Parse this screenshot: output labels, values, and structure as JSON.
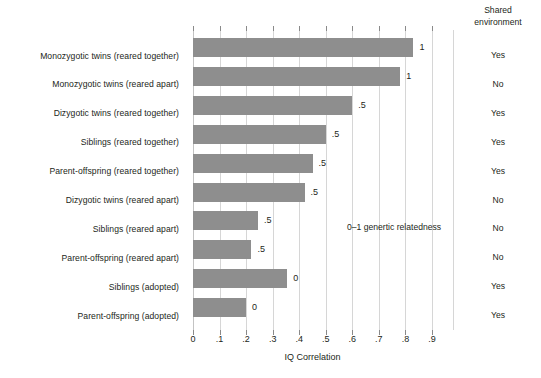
{
  "chart_data": {
    "type": "bar",
    "orientation": "horizontal",
    "title": "",
    "xlabel": "IQ Correlation",
    "ylabel": "",
    "xlim": [
      0,
      0.9
    ],
    "xticks": [
      "0",
      ".1",
      ".2",
      ".3",
      ".4",
      ".5",
      ".6",
      ".7",
      ".8",
      ".9"
    ],
    "xtick_values": [
      0,
      0.1,
      0.2,
      0.3,
      0.4,
      0.5,
      0.6,
      0.7,
      0.8,
      0.9
    ],
    "grid": true,
    "legend": null,
    "annotations": [
      {
        "text": "0–1 genertic relatedness",
        "x": 0.58,
        "y_row": 7
      }
    ],
    "categories": [
      "Monozygotic twins (reared together)",
      "Monozygotic twins (reared apart)",
      "Dizygotic twins (reared together)",
      "Siblings (reared together)",
      "Parent-offspring (reared together)",
      "Dizygotic twins (reared apart)",
      "Siblings (reared apart)",
      "Parent-offspring (reared apart)",
      "Siblings (adopted)",
      "Parent-offspring (adopted)"
    ],
    "values": [
      0.83,
      0.78,
      0.6,
      0.5,
      0.45,
      0.42,
      0.245,
      0.22,
      0.355,
      0.2
    ],
    "bar_labels": [
      "1",
      "1",
      ".5",
      ".5",
      ".5",
      ".5",
      ".5",
      ".5",
      "0",
      "0"
    ],
    "bar_color": "#8e8e8e",
    "extra_column": {
      "header_line1": "Shared",
      "header_line2": "environment",
      "values": [
        "Yes",
        "No",
        "Yes",
        "Yes",
        "Yes",
        "No",
        "No",
        "No",
        "Yes",
        "Yes"
      ]
    }
  }
}
